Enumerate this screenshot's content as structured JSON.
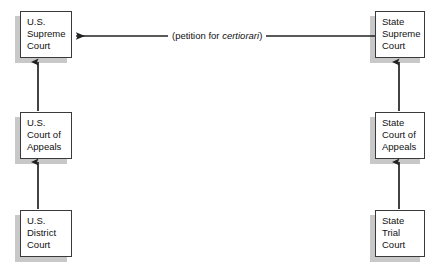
{
  "diagram": {
    "background": "#ffffff",
    "box_border_color": "#3a3a3a",
    "box_shadow_color": "#c8c8c8",
    "line_color": "#222222",
    "nodes": [
      {
        "id": "us-supreme-court",
        "label": "U.S.\nSupreme\nCourt",
        "column": "federal",
        "tier": "supreme",
        "x": 20,
        "y": 11,
        "w": 52,
        "h": 47
      },
      {
        "id": "us-court-of-appeals",
        "label": "U.S.\nCourt of\nAppeals",
        "column": "federal",
        "tier": "appeals",
        "x": 20,
        "y": 112,
        "w": 52,
        "h": 47
      },
      {
        "id": "us-district-court",
        "label": "U.S.\nDistrict\nCourt",
        "column": "federal",
        "tier": "trial",
        "x": 20,
        "y": 210,
        "w": 52,
        "h": 47
      },
      {
        "id": "state-supreme-court",
        "label": "State\nSupreme\nCourt",
        "column": "state",
        "tier": "supreme",
        "x": 375,
        "y": 11,
        "w": 50,
        "h": 47
      },
      {
        "id": "state-court-of-appeals",
        "label": "State\nCourt of\nAppeals",
        "column": "state",
        "tier": "appeals",
        "x": 375,
        "y": 112,
        "w": 50,
        "h": 47
      },
      {
        "id": "state-trial-court",
        "label": "State\nTrial\nCourt",
        "column": "state",
        "tier": "trial",
        "x": 375,
        "y": 210,
        "w": 50,
        "h": 47
      }
    ],
    "edges": [
      {
        "id": "district-to-appeals",
        "from": "us-district-court",
        "to": "us-court-of-appeals",
        "direction": "up",
        "label": ""
      },
      {
        "id": "appeals-to-supreme",
        "from": "us-court-of-appeals",
        "to": "us-supreme-court",
        "direction": "up",
        "label": ""
      },
      {
        "id": "state-trial-to-appeals",
        "from": "state-trial-court",
        "to": "state-court-of-appeals",
        "direction": "up",
        "label": ""
      },
      {
        "id": "state-appeals-to-supreme",
        "from": "state-court-of-appeals",
        "to": "state-supreme-court",
        "direction": "up",
        "label": ""
      },
      {
        "id": "certiorari-petition",
        "from": "state-supreme-court",
        "to": "us-supreme-court",
        "direction": "left",
        "label_prefix": "(petition for ",
        "label_italic": "certiorari",
        "label_suffix": ")"
      }
    ]
  }
}
